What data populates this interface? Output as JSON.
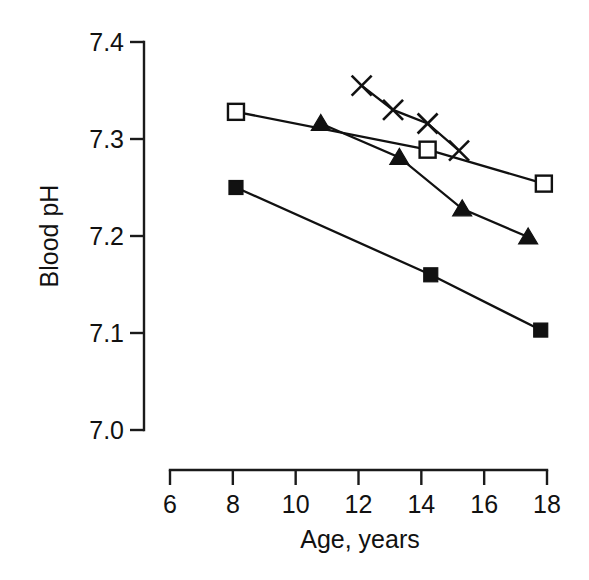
{
  "chart_data": {
    "type": "line",
    "title": "",
    "subtitle": "",
    "xlabel": "Age,  years",
    "ylabel": "Blood pH",
    "xlim": [
      6,
      18
    ],
    "ylim": [
      7.0,
      7.4
    ],
    "x_ticks": [
      6,
      8,
      10,
      12,
      14,
      16,
      18
    ],
    "x_tick_labels": [
      "6",
      "8",
      "10",
      "12",
      "14",
      "16",
      "18"
    ],
    "y_ticks": [
      7.0,
      7.1,
      7.2,
      7.3,
      7.4
    ],
    "y_tick_labels": [
      "7.0",
      "7.1",
      "7.2",
      "7.3",
      "7.4"
    ],
    "grid": false,
    "legend": false,
    "legend_position": "none",
    "series": [
      {
        "name": "open-square",
        "marker": "open square",
        "color": "#111111",
        "points": [
          {
            "x": 8.1,
            "y": 7.328
          },
          {
            "x": 14.2,
            "y": 7.289
          },
          {
            "x": 17.9,
            "y": 7.254
          }
        ]
      },
      {
        "name": "filled-triangle",
        "marker": "filled triangle",
        "color": "#111111",
        "points": [
          {
            "x": 10.8,
            "y": 7.316
          },
          {
            "x": 13.3,
            "y": 7.281
          },
          {
            "x": 15.3,
            "y": 7.228
          },
          {
            "x": 17.4,
            "y": 7.199
          }
        ]
      },
      {
        "name": "cross",
        "marker": "x cross",
        "color": "#111111",
        "points": [
          {
            "x": 12.1,
            "y": 7.355
          },
          {
            "x": 13.1,
            "y": 7.33
          },
          {
            "x": 14.2,
            "y": 7.316
          },
          {
            "x": 15.2,
            "y": 7.288
          }
        ]
      },
      {
        "name": "filled-square",
        "marker": "filled square",
        "color": "#111111",
        "points": [
          {
            "x": 8.1,
            "y": 7.25
          },
          {
            "x": 14.3,
            "y": 7.16
          },
          {
            "x": 17.8,
            "y": 7.103
          }
        ]
      }
    ]
  }
}
